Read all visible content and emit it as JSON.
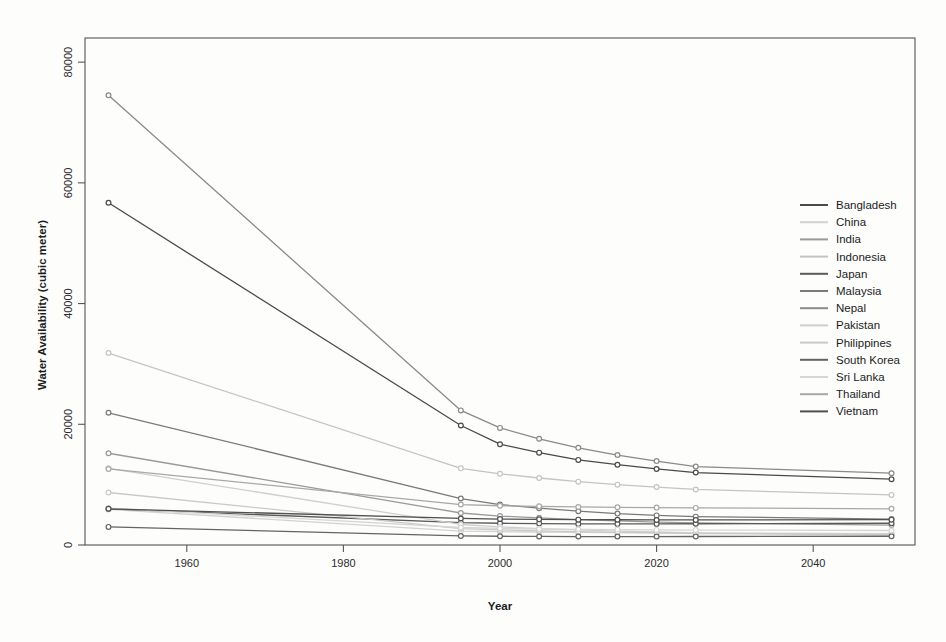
{
  "chart_data": {
    "type": "line",
    "title": "",
    "xlabel": "Year",
    "ylabel": "Water Availability (cubic meter)",
    "xlim": [
      1947,
      2053
    ],
    "ylim": [
      0,
      84000
    ],
    "xticks": [
      1960,
      1980,
      2000,
      2020,
      2040
    ],
    "xtick_labels": [
      "1960",
      "1980",
      "2000",
      "2020",
      "2040"
    ],
    "yticks": [
      0,
      20000,
      40000,
      60000,
      80000
    ],
    "ytick_labels": [
      "0",
      "20000",
      "40000",
      "60000",
      "80000"
    ],
    "grid": false,
    "legend_position": "right",
    "marker": "circle",
    "x": [
      1950,
      1995,
      2000,
      2005,
      2010,
      2015,
      2020,
      2025,
      2050
    ],
    "series": [
      {
        "name": "Bangladesh",
        "color": "#4a4a4a",
        "values": [
          56700,
          19800,
          16700,
          15300,
          14100,
          13300,
          12600,
          12000,
          10900
        ]
      },
      {
        "name": "China",
        "color": "#d2d2d2",
        "values": [
          5900,
          2300,
          2200,
          2150,
          2100,
          2050,
          2000,
          1980,
          1900
        ]
      },
      {
        "name": "India",
        "color": "#9a9a9a",
        "values": [
          15200,
          5300,
          4800,
          4500,
          4200,
          4000,
          3800,
          3650,
          3300
        ]
      },
      {
        "name": "Indonesia",
        "color": "#c4c4c4",
        "values": [
          31800,
          12700,
          11800,
          11100,
          10500,
          10000,
          9600,
          9200,
          8300
        ]
      },
      {
        "name": "Japan",
        "color": "#5a5a5a",
        "values": [
          6000,
          3700,
          3600,
          3550,
          3500,
          3500,
          3500,
          3520,
          3600
        ]
      },
      {
        "name": "Malaysia",
        "color": "#7a7a7a",
        "values": [
          21900,
          7700,
          6700,
          6100,
          5600,
          5200,
          4900,
          4700,
          4300
        ]
      },
      {
        "name": "Nepal",
        "color": "#8a8a8a",
        "values": [
          74500,
          22300,
          19400,
          17600,
          16100,
          14900,
          13900,
          13000,
          11900
        ]
      },
      {
        "name": "Pakistan",
        "color": "#cfcfcf",
        "values": [
          12700,
          3400,
          3000,
          2700,
          2500,
          2300,
          2150,
          2000,
          1700
        ]
      },
      {
        "name": "Philippines",
        "color": "#c9c9c9",
        "values": [
          8700,
          2700,
          2500,
          2350,
          2200,
          2100,
          2000,
          1900,
          1700
        ]
      },
      {
        "name": "South Korea",
        "color": "#646464",
        "values": [
          3000,
          1500,
          1450,
          1420,
          1400,
          1400,
          1400,
          1410,
          1450
        ]
      },
      {
        "name": "Sri Lanka",
        "color": "#d6d6d6",
        "values": [
          6100,
          2900,
          2750,
          2650,
          2600,
          2550,
          2500,
          2480,
          2400
        ]
      },
      {
        "name": "Thailand",
        "color": "#a8a8a8",
        "values": [
          12600,
          6700,
          6500,
          6400,
          6300,
          6250,
          6200,
          6150,
          6000
        ]
      },
      {
        "name": "Vietnam",
        "color": "#505050",
        "values": [
          6000,
          4400,
          4300,
          4250,
          4200,
          4180,
          4150,
          4150,
          4200
        ]
      }
    ]
  },
  "legend": {
    "entries": [
      "Bangladesh",
      "China",
      "India",
      "Indonesia",
      "Japan",
      "Malaysia",
      "Nepal",
      "Pakistan",
      "Philippines",
      "South Korea",
      "Sri Lanka",
      "Thailand",
      "Vietnam"
    ]
  },
  "axes": {
    "x_title": "Year",
    "y_title": "Water Availability (cubic meter)"
  }
}
